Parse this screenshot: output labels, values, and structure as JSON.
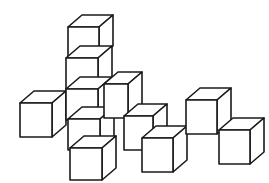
{
  "figure": {
    "background_color": "#ffffff",
    "line_color": "#1a1a1a",
    "face_fill_color": "#ffffff",
    "canvas": {
      "width": 269,
      "height": 183
    }
  },
  "geometry": {
    "projection": "isometric",
    "cube_face_width": 30,
    "cube_face_height": 33,
    "depth_dx": 13,
    "depth_dy": -11,
    "stroke_width": 1.6,
    "heavy_stroke_width": 2.4
  },
  "groups": [
    {
      "name": "left-single",
      "count": 1,
      "label": "Single cube, left"
    },
    {
      "name": "center-stack",
      "count": 5,
      "label": "Vertical stack of five cubes"
    },
    {
      "name": "middle-diagonal",
      "count": 3,
      "label": "Descending diagonal of three cubes"
    },
    {
      "name": "right-pair",
      "count": 2,
      "label": "Pair of cubes, right"
    }
  ],
  "cubes": [
    {
      "id": "cube-left-1",
      "group": "left-single",
      "x": 20,
      "y": 103,
      "w": 32,
      "h": 34,
      "dx": 14,
      "dy": -12,
      "order": 1
    },
    {
      "id": "cube-stack-top",
      "group": "center-stack",
      "x": 68,
      "y": 27,
      "w": 31,
      "h": 31,
      "dx": 14,
      "dy": -12,
      "order": 2
    },
    {
      "id": "cube-stack-2",
      "group": "center-stack",
      "x": 66,
      "y": 58,
      "w": 32,
      "h": 31,
      "dx": 14,
      "dy": -12,
      "order": 3
    },
    {
      "id": "cube-stack-3",
      "group": "center-stack",
      "x": 66,
      "y": 89,
      "w": 32,
      "h": 31,
      "dx": 14,
      "dy": -12,
      "order": 4
    },
    {
      "id": "cube-stack-4",
      "group": "center-stack",
      "x": 68,
      "y": 119,
      "w": 32,
      "h": 31,
      "dx": 14,
      "dy": -12,
      "order": 5
    },
    {
      "id": "cube-stack-base",
      "group": "center-stack",
      "x": 70,
      "y": 148,
      "w": 32,
      "h": 32,
      "dx": 14,
      "dy": -12,
      "order": 6
    },
    {
      "id": "cube-mid-1",
      "group": "middle-diagonal",
      "x": 104,
      "y": 84,
      "w": 24,
      "h": 34,
      "dx": 14,
      "dy": -12,
      "order": 7
    },
    {
      "id": "cube-mid-2",
      "group": "middle-diagonal",
      "x": 124,
      "y": 116,
      "w": 29,
      "h": 34,
      "dx": 14,
      "dy": -12,
      "order": 8
    },
    {
      "id": "cube-mid-3",
      "group": "middle-diagonal",
      "x": 142,
      "y": 138,
      "w": 31,
      "h": 34,
      "dx": 14,
      "dy": -12,
      "order": 9
    },
    {
      "id": "cube-right-1",
      "group": "right-pair",
      "x": 186,
      "y": 100,
      "w": 31,
      "h": 34,
      "dx": 14,
      "dy": -12,
      "order": 10
    },
    {
      "id": "cube-right-2",
      "group": "right-pair",
      "x": 219,
      "y": 130,
      "w": 31,
      "h": 34,
      "dx": 14,
      "dy": -12,
      "order": 11
    }
  ]
}
